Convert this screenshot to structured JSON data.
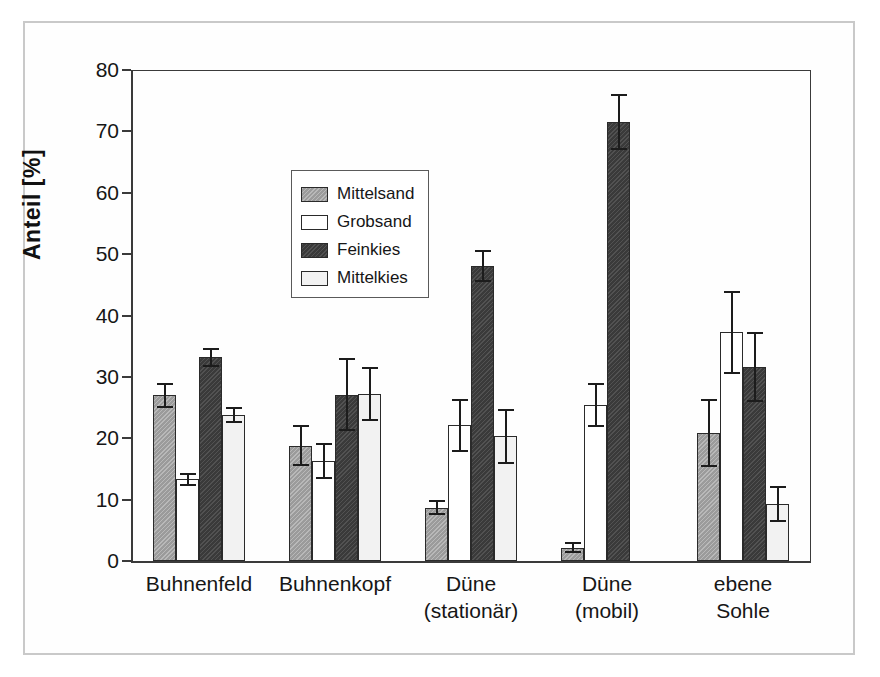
{
  "chart_data": {
    "type": "bar",
    "title": "",
    "subtitle": "",
    "xlabel": "",
    "ylabel": "Anteil [%]",
    "ylim": [
      0,
      80
    ],
    "yticks": [
      0,
      10,
      20,
      30,
      40,
      50,
      60,
      70,
      80
    ],
    "grid": false,
    "legend_position": "upper-left-inside",
    "orientation": "vertical",
    "error_bars": "symmetric standard deviation",
    "categories": [
      "Buhnenfeld",
      "Buhnenkopf",
      "Düne\n(stationär)",
      "Düne\n(mobil)",
      "ebene\nSohle"
    ],
    "category_lines": [
      [
        "Buhnenfeld"
      ],
      [
        "Buhnenkopf"
      ],
      [
        "Düne",
        "(stationär)"
      ],
      [
        "Düne",
        "(mobil)"
      ],
      [
        "ebene",
        "Sohle"
      ]
    ],
    "series": [
      {
        "name": "Mittelsand",
        "color": "#9b9b9b",
        "pattern": "hatched-gray",
        "values": [
          27.0,
          18.8,
          8.7,
          2.2,
          20.8
        ],
        "errors": [
          1.9,
          3.2,
          1.0,
          0.7,
          5.4
        ]
      },
      {
        "name": "Grobsand",
        "color": "#ffffff",
        "pattern": "solid-white",
        "values": [
          13.3,
          16.3,
          22.1,
          25.4,
          37.3
        ],
        "errors": [
          0.9,
          2.7,
          4.2,
          3.4,
          6.6
        ]
      },
      {
        "name": "Feinkies",
        "color": "#3a3a3a",
        "pattern": "dark-hatched",
        "values": [
          33.2,
          27.1,
          48.1,
          71.5,
          31.6
        ],
        "errors": [
          1.4,
          5.8,
          2.4,
          4.4,
          5.6
        ]
      },
      {
        "name": "Mittelkies",
        "color": "#f2f2f2",
        "pattern": "solid-light",
        "values": [
          23.8,
          27.2,
          20.3,
          0.0,
          9.3
        ],
        "errors": [
          1.2,
          4.3,
          4.3,
          0.0,
          2.8
        ]
      }
    ]
  },
  "legend": {
    "items": [
      {
        "label": "Mittelsand",
        "swatch": "mittelsand"
      },
      {
        "label": "Grobsand",
        "swatch": "grobsand"
      },
      {
        "label": "Feinkies",
        "swatch": "feinkies"
      },
      {
        "label": "Mittelkies",
        "swatch": "mittelkies"
      }
    ]
  },
  "axis": {
    "y_title": "Anteil [%]",
    "y_tick_labels": [
      "0",
      "10",
      "20",
      "30",
      "40",
      "50",
      "60",
      "70",
      "80"
    ]
  },
  "colors": {
    "mittelsand": "#9b9b9b",
    "grobsand": "#ffffff",
    "feinkies": "#3a3a3a",
    "mittelkies": "#f2f2f2",
    "axis": "#3a3a3a",
    "frame": "#c9c9c9",
    "text": "#161616"
  }
}
